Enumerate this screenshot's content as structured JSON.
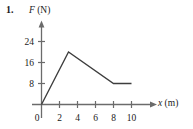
{
  "problem": {
    "number": "1."
  },
  "axis_titles": {
    "y_symbol": "F",
    "y_unit": "(N)",
    "x_symbol": "x",
    "x_unit": "(m)"
  },
  "chart_data": {
    "type": "line",
    "title": "",
    "xlabel": "x (m)",
    "ylabel": "F (N)",
    "xlim": [
      0,
      11
    ],
    "ylim": [
      0,
      26
    ],
    "grid": false,
    "legend": "none",
    "x_ticks": [
      0,
      2,
      4,
      6,
      8,
      10
    ],
    "x_tick_labels": [
      "0",
      "2",
      "4",
      "6",
      "8",
      "10"
    ],
    "y_ticks": [
      8,
      16,
      24
    ],
    "y_tick_labels": [
      "8",
      "16",
      "24"
    ],
    "origin_label": "0",
    "series": [
      {
        "name": "Force",
        "x": [
          0,
          3,
          8,
          10
        ],
        "values": [
          0,
          20,
          8,
          8
        ]
      }
    ],
    "line_color": "#3d3d3d",
    "axis_color": "#6b6b6b"
  },
  "colors": {
    "ink": "#1a1a1a",
    "line": "#3d3d3d",
    "axis": "#6b6b6b",
    "background": "#ffffff"
  }
}
